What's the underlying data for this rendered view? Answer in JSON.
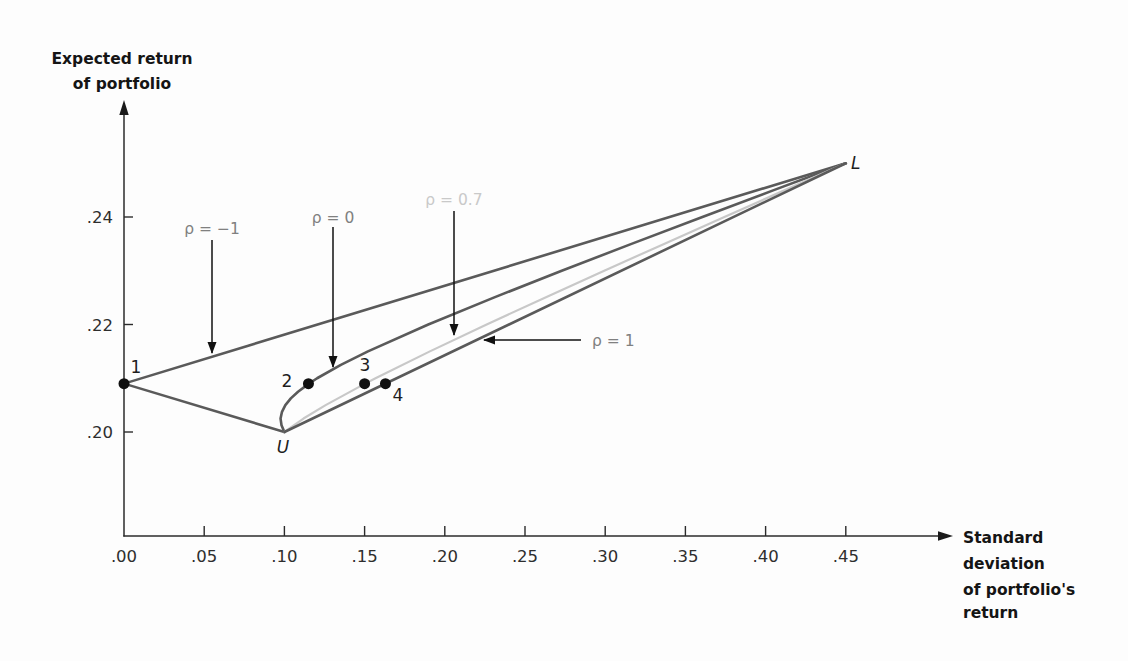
{
  "chart_data": {
    "type": "line",
    "title": "",
    "xlabel": "Standard deviation of portfolio's return",
    "ylabel": "Expected return of portfolio",
    "xlabel_lines": [
      "Standard",
      "deviation",
      "of portfolio's",
      "return"
    ],
    "ylabel_lines": [
      "Expected return",
      "of portfolio"
    ],
    "x_tick_labels": [
      ".00",
      ".05",
      ".10",
      ".15",
      ".20",
      ".25",
      ".30",
      ".35",
      ".40",
      ".45"
    ],
    "x_tick_values": [
      0.0,
      0.05,
      0.1,
      0.15,
      0.2,
      0.25,
      0.3,
      0.35,
      0.4,
      0.45
    ],
    "y_tick_labels": [
      ".20",
      ".22",
      ".24"
    ],
    "y_tick_values": [
      0.2,
      0.22,
      0.24
    ],
    "xlim": [
      0.0,
      0.516
    ],
    "ylim": [
      0.181,
      0.262
    ],
    "grid": false,
    "legend": "none (series labeled by arrow annotations)",
    "colors": {
      "dark_line": "#5a5a5a",
      "light_line": "#c8c8c8",
      "axis": "#2b2b2b",
      "point": "#111111"
    },
    "series": [
      {
        "name": "ρ = −1",
        "color": "#5a5a5a",
        "width": 2.6,
        "x": [
          0.1,
          0.0,
          0.45
        ],
        "y": [
          0.2,
          0.209,
          0.25
        ]
      },
      {
        "name": "ρ = 0",
        "color": "#5a5a5a",
        "width": 2.6,
        "x": [
          0.1,
          0.0982,
          0.0976,
          0.0985,
          0.1006,
          0.104,
          0.1085,
          0.1153,
          0.1204,
          0.1352,
          0.1521,
          0.1897,
          0.2305,
          0.2729,
          0.3164,
          0.3606,
          0.4051,
          0.45
        ],
        "y": [
          0.2,
          0.20125,
          0.2025,
          0.20375,
          0.205,
          0.20625,
          0.2075,
          0.209,
          0.21,
          0.2125,
          0.215,
          0.22,
          0.225,
          0.23,
          0.235,
          0.24,
          0.245,
          0.25
        ]
      },
      {
        "name": "ρ = 0.7",
        "color": "#c8c8c8",
        "width": 2.2,
        "x": [
          0.1,
          0.1119,
          0.1257,
          0.1503,
          0.1568,
          0.1907,
          0.2261,
          0.2624,
          0.2994,
          0.3367,
          0.3743,
          0.4121,
          0.45
        ],
        "y": [
          0.2,
          0.2025,
          0.205,
          0.209,
          0.21,
          0.215,
          0.22,
          0.225,
          0.23,
          0.235,
          0.24,
          0.245,
          0.25
        ]
      },
      {
        "name": "ρ = 1",
        "color": "#5a5a5a",
        "width": 2.6,
        "x": [
          0.1,
          0.45
        ],
        "y": [
          0.2,
          0.25
        ]
      }
    ],
    "points": [
      {
        "label": "1",
        "x": 0.0,
        "y": 0.209,
        "marker": true
      },
      {
        "label": "2",
        "x": 0.115,
        "y": 0.209,
        "marker": true
      },
      {
        "label": "3",
        "x": 0.15,
        "y": 0.209,
        "marker": true
      },
      {
        "label": "4",
        "x": 0.163,
        "y": 0.209,
        "marker": true
      },
      {
        "label": "U",
        "x": 0.1,
        "y": 0.2,
        "marker": false
      },
      {
        "label": "L",
        "x": 0.45,
        "y": 0.25,
        "marker": false
      }
    ],
    "annotations": [
      {
        "text": "ρ = −1",
        "points_to": "ρ = −1 line (1 to L)"
      },
      {
        "text": "ρ = 0",
        "points_to": "ρ = 0 curve"
      },
      {
        "text": "ρ = 0.7",
        "points_to": "ρ = 0.7 curve"
      },
      {
        "text": "ρ = 1",
        "points_to": "ρ = 1 line (U to L)"
      }
    ]
  }
}
